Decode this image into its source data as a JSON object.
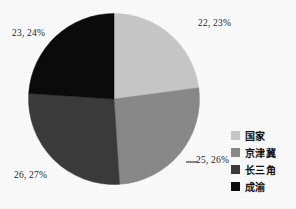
{
  "chart_data": {
    "type": "pie",
    "title": "",
    "subtitle": "",
    "xlabel": "",
    "ylabel": "",
    "grid": false,
    "legend_position": "right",
    "start_angle_deg": 0,
    "direction": "clockwise",
    "categories": [
      "国家",
      "京津冀",
      "长三角",
      "成渝"
    ],
    "values": [
      22,
      25,
      26,
      23
    ],
    "percentages": [
      23,
      26,
      27,
      24
    ],
    "data_labels": [
      "22, 23%",
      "25, 26%",
      "26, 27%",
      "23, 24%"
    ],
    "slice_colors": [
      "#c9c9c9",
      "#8a8a8a",
      "#3b3b3b",
      "#0b0b0b"
    ],
    "slices": [
      {
        "name": "国家",
        "value": 22,
        "percent": 23,
        "label": "22, 23%",
        "color": "#c9c9c9"
      },
      {
        "name": "京津冀",
        "value": 25,
        "percent": 26,
        "label": "25, 26%",
        "color": "#8a8a8a"
      },
      {
        "name": "长三角",
        "value": 26,
        "percent": 27,
        "label": "26, 27%",
        "color": "#3b3b3b"
      },
      {
        "name": "成渝",
        "value": 23,
        "percent": 24,
        "label": "23, 24%",
        "color": "#0b0b0b"
      }
    ]
  },
  "labels": {
    "slice_0": "22, 23%",
    "slice_1": "25, 26%",
    "slice_2": "26, 27%",
    "slice_3": "23, 24%"
  },
  "legend": {
    "items": [
      {
        "label": "国家",
        "color": "#c9c9c9"
      },
      {
        "label": "京津冀",
        "color": "#8a8a8a"
      },
      {
        "label": "长三角",
        "color": "#3b3b3b"
      },
      {
        "label": "成渝",
        "color": "#0b0b0b"
      }
    ]
  },
  "colors": {
    "background": "#fdfdfd",
    "text": "#1d1d1d",
    "leader_line": "#2a2a2a"
  }
}
